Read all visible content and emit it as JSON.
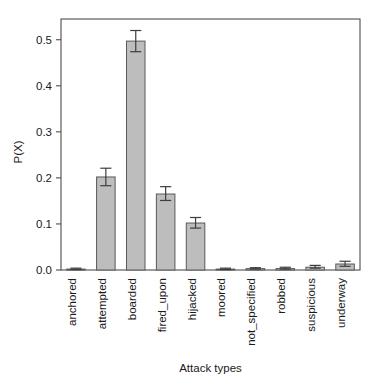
{
  "chart_data": {
    "type": "bar",
    "title": "",
    "xlabel": "Attack types",
    "ylabel": "P(X)",
    "categories": [
      "anchored",
      "attempted",
      "boarded",
      "fired_upon",
      "hijacked",
      "moored",
      "not_specified",
      "robbed",
      "suspicious",
      "underway"
    ],
    "values": [
      0.002,
      0.202,
      0.497,
      0.165,
      0.102,
      0.002,
      0.003,
      0.003,
      0.006,
      0.013
    ],
    "errors_low": [
      0.001,
      0.183,
      0.474,
      0.151,
      0.091,
      0.001,
      0.002,
      0.002,
      0.004,
      0.008
    ],
    "errors_high": [
      0.004,
      0.221,
      0.52,
      0.181,
      0.114,
      0.004,
      0.005,
      0.006,
      0.01,
      0.019
    ],
    "yticks": [
      0.0,
      0.1,
      0.2,
      0.3,
      0.4,
      0.5
    ],
    "ytick_labels": [
      "0.0",
      "0.1",
      "0.2",
      "0.3",
      "0.4",
      "0.5"
    ],
    "ylim": [
      0.0,
      0.545
    ],
    "grid": false,
    "legend": null,
    "bar_fill_color": "#bdbdbd",
    "bar_edge_color": "#595959",
    "error_bar_color": "#3d3d3d",
    "axis_color": "#4d4d4d",
    "text_color": "#1a1a1a",
    "background_color": "#ffffff",
    "xlabel_rotation": 90,
    "ylabel_rotation": 90
  }
}
